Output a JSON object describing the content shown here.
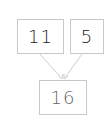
{
  "diagram": {
    "nodes": [
      {
        "id": "n1",
        "label": "11"
      },
      {
        "id": "n2",
        "label": "5"
      },
      {
        "id": "n3",
        "label": "16"
      }
    ],
    "edges": [
      {
        "from": "n1",
        "to": "n3"
      },
      {
        "from": "n2",
        "to": "n3"
      }
    ],
    "colors": {
      "border": "#c8c8c8",
      "edge": "#cfcfcf",
      "text": "#333333"
    }
  }
}
